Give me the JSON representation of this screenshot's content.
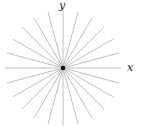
{
  "diagram": {
    "title": "",
    "center": {
      "x": 63,
      "y": 68
    },
    "radius": 58,
    "ray_count": 24,
    "angle_step_deg": 15,
    "ray_color": "#b8b8b8",
    "center_dot_color": "#111111",
    "axis_labels": {
      "x": "x",
      "y": "y"
    }
  }
}
